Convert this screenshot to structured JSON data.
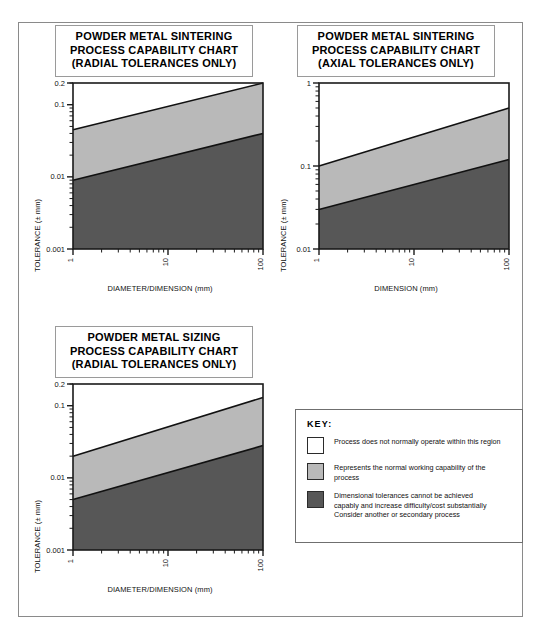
{
  "page": {
    "border_color": "#8a8a8a"
  },
  "colors": {
    "band_normal": "#b9b9b9",
    "band_difficult": "#575757",
    "band_outside": "#ffffff",
    "axis": "#1a1a1a",
    "swatch_border": "#2b2b2b"
  },
  "charts": [
    {
      "id": "powder-metal-sintering-radial",
      "title_lines": [
        "POWDER METAL SINTERING",
        "PROCESS CAPABILITY CHART",
        "(RADIAL TOLERANCES ONLY)"
      ],
      "chart_data": {
        "type": "area",
        "title": "POWDER METAL SINTERING PROCESS CAPABILITY CHART (RADIAL TOLERANCES ONLY)",
        "xlabel": "DIAMETER/DIMENSION (mm)",
        "ylabel": "TOLERANCE (± mm)",
        "xscale": "log",
        "yscale": "log",
        "xlim": [
          1,
          100
        ],
        "ylim": [
          0.001,
          0.2
        ],
        "xticks": [
          "1",
          "10",
          "100"
        ],
        "yticks": [
          "0.001",
          "0.01",
          "0.1",
          "0.2"
        ],
        "grid": false,
        "legend": "external-key",
        "series": [
          {
            "name": "Upper boundary (normal working capability limit)",
            "x": [
              1,
              100
            ],
            "y": [
              0.045,
              0.2
            ]
          },
          {
            "name": "Lower boundary (difficult / costly below)",
            "x": [
              1,
              100
            ],
            "y": [
              0.009,
              0.04
            ]
          }
        ],
        "regions": [
          {
            "name": "Process does not normally operate within this region",
            "fill": "#ffffff"
          },
          {
            "name": "Represents the normal working capability of the process",
            "fill": "#b9b9b9"
          },
          {
            "name": "Dimensional tolerances cannot be achieved capably",
            "fill": "#575757"
          }
        ]
      }
    },
    {
      "id": "powder-metal-sintering-axial",
      "title_lines": [
        "POWDER METAL SINTERING",
        "PROCESS CAPABILITY CHART",
        "(AXIAL TOLERANCES ONLY)"
      ],
      "chart_data": {
        "type": "area",
        "title": "POWDER METAL SINTERING PROCESS CAPABILITY CHART (AXIAL TOLERANCES ONLY)",
        "xlabel": "DIMENSION (mm)",
        "ylabel": "TOLERANCE (± mm)",
        "xscale": "log",
        "yscale": "log",
        "xlim": [
          1,
          100
        ],
        "ylim": [
          0.01,
          1
        ],
        "xticks": [
          "1",
          "10",
          "100"
        ],
        "yticks": [
          "0.01",
          "0.1",
          "1"
        ],
        "grid": false,
        "legend": "external-key",
        "series": [
          {
            "name": "Upper boundary (normal working capability limit)",
            "x": [
              1,
              100
            ],
            "y": [
              0.1,
              0.5
            ]
          },
          {
            "name": "Lower boundary (difficult / costly below)",
            "x": [
              1,
              100
            ],
            "y": [
              0.03,
              0.12
            ]
          }
        ],
        "regions": [
          {
            "name": "Process does not normally operate within this region",
            "fill": "#ffffff"
          },
          {
            "name": "Represents the normal working capability of the process",
            "fill": "#b9b9b9"
          },
          {
            "name": "Dimensional tolerances cannot be achieved capably",
            "fill": "#575757"
          }
        ]
      }
    },
    {
      "id": "powder-metal-sizing-radial",
      "title_lines": [
        "POWDER METAL SIZING",
        "PROCESS CAPABILITY CHART",
        "(RADIAL TOLERANCES ONLY)"
      ],
      "chart_data": {
        "type": "area",
        "title": "POWDER METAL SIZING PROCESS CAPABILITY CHART (RADIAL TOLERANCES ONLY)",
        "xlabel": "DIAMETER/DIMENSION (mm)",
        "ylabel": "TOLERANCE (± mm)",
        "xscale": "log",
        "yscale": "log",
        "xlim": [
          1,
          100
        ],
        "ylim": [
          0.001,
          0.2
        ],
        "xticks": [
          "1",
          "10",
          "100"
        ],
        "yticks": [
          "0.001",
          "0.01",
          "0.1",
          "0.2"
        ],
        "grid": false,
        "legend": "external-key",
        "series": [
          {
            "name": "Upper boundary (normal working capability limit)",
            "x": [
              1,
              100
            ],
            "y": [
              0.02,
              0.13
            ]
          },
          {
            "name": "Lower boundary (difficult / costly below)",
            "x": [
              1,
              100
            ],
            "y": [
              0.005,
              0.028
            ]
          }
        ],
        "regions": [
          {
            "name": "Process does not normally operate within this region",
            "fill": "#ffffff"
          },
          {
            "name": "Represents the normal working capability of the process",
            "fill": "#b9b9b9"
          },
          {
            "name": "Dimensional tolerances cannot be achieved capably",
            "fill": "#575757"
          }
        ]
      }
    }
  ],
  "key": {
    "heading": "KEY:",
    "items": [
      {
        "swatch": "#ffffff",
        "lines": [
          "Process does not normally operate within this region"
        ]
      },
      {
        "swatch": "#b9b9b9",
        "lines": [
          "Represents the normal working capability of the",
          "process"
        ]
      },
      {
        "swatch": "#575757",
        "lines": [
          "Dimensional tolerances cannot be achieved",
          "capably and increase difficulty/cost substantially",
          "Consider another or secondary process"
        ]
      }
    ]
  }
}
